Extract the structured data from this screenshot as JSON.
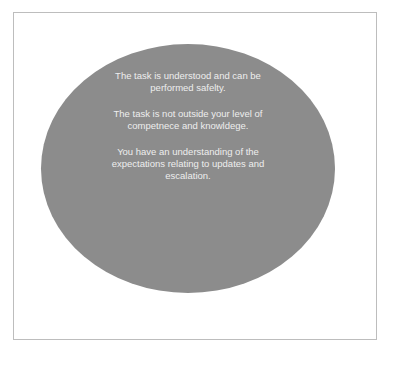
{
  "diagram": {
    "shape": "ellipse",
    "colors": {
      "ellipse_fill": "#8c8c8c",
      "text": "#eeeeee",
      "frame_border": "#bdbdbd",
      "background": "#ffffff"
    },
    "paragraphs": [
      {
        "text": "The task is understood and can be performed safelty."
      },
      {
        "text": "The task is not outside your level of competnece and knowldege."
      },
      {
        "text": "You have an understanding of the expectations relating to updates and escalation."
      }
    ]
  }
}
